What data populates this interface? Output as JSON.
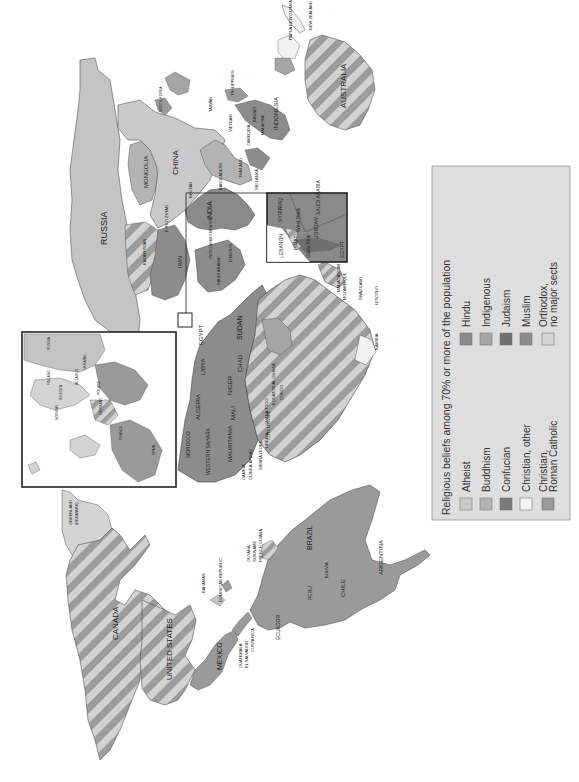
{
  "map": {
    "title": "Religious beliefs among 70% or more of the population",
    "orientation": "rotated-90-counterclockwise",
    "fill_colors": {
      "atheist": "#c9c9c9",
      "buddhism": "#b3b3b3",
      "confucian": "#7a7a7a",
      "christian_other": "#f2f2f2",
      "christian_roman_catholic": "#9a9a9a",
      "hindu": "#8a8a8a",
      "indigenous": "#a5a5a5",
      "judaism": "#6f6f6f",
      "muslim": "#8c8c8c",
      "orthodox": "#d4d4d4",
      "no_majority": "#c4c4c4",
      "stripe_dark": "#9c9c9c",
      "stripe_light": "#d2d2d2",
      "ocean": "#ffffff",
      "legend_bg": "#dedede",
      "border": "#333333"
    },
    "legend": {
      "title": "Religious beliefs among 70% or more of the population",
      "items": [
        {
          "key": "atheist",
          "label": "Atheist"
        },
        {
          "key": "buddhism",
          "label": "Buddhism"
        },
        {
          "key": "confucian",
          "label": "Confucian"
        },
        {
          "key": "christian_other",
          "label": "Christian, other"
        },
        {
          "key": "christian_roman_catholic",
          "label": "Christian,",
          "label2": "Roman Catholic"
        },
        {
          "key": "hindu",
          "label": "Hindu"
        },
        {
          "key": "indigenous",
          "label": "Indigenous"
        },
        {
          "key": "judaism",
          "label": "Judaism"
        },
        {
          "key": "muslim",
          "label": "Muslim"
        },
        {
          "key": "orthodox",
          "label": "Orthodox,",
          "label2": "no major sects"
        }
      ]
    },
    "countries": {
      "canada": "CANADA",
      "united_states": "UNITED STATES",
      "mexico": "MEXICO",
      "greenland": "GREENLAND",
      "greenland_sub": "(DENMARK)",
      "bahamas": "BAHAMAS",
      "cuba": "CUBA",
      "jamaica": "JAMAICA",
      "haiti": "HAITI",
      "dominican_republic": "DOMINICAN REPUBLIC",
      "belize": "BELIZE",
      "honduras": "HONDURAS",
      "guatemala": "GUATEMALA",
      "el_salvador": "EL SALVADOR",
      "nicaragua": "NICARAGUA",
      "costa_rica": "COSTA RICA",
      "panama": "PANAMA",
      "guyana": "GUYANA",
      "suriname": "SURINAME",
      "french_guiana": "FRENCH GUIANA",
      "venezuela": "VENEZUELA",
      "colombia": "COLOMBIA",
      "ecuador": "ECUADOR",
      "peru": "PERU",
      "brazil": "BRAZIL",
      "bolivia": "BOLIVIA",
      "paraguay": "PARAGUAY",
      "uruguay": "URUGUAY",
      "chile": "CHILE",
      "argentina": "ARGENTINA",
      "iceland": "ICELAND",
      "russia": "RUSSIA",
      "mongolia": "MONGOLIA",
      "china": "CHINA",
      "kazakhstan": "KAZAKHSTAN",
      "kyrgyzstan": "KYRGYZSTAN",
      "india": "INDIA",
      "bhutan": "BHUTAN",
      "bangladesh": "BANGLADESH",
      "sri_lanka": "SRI LANKA",
      "thailand": "THAILAND",
      "cambodia": "CAMBODIA",
      "vietnam": "VIETNAM",
      "malaysia": "MALAYSIA",
      "brunei": "BRUNEI",
      "philippines": "PHILIPPINES",
      "taiwan": "TAIWAN",
      "north_korea": "NORTH KOREA",
      "south_korea": "SOUTH KOREA",
      "japan": "JAPAN",
      "indonesia": "INDONESIA",
      "papua_new_guinea": "PAPUA NEW GUINEA",
      "australia": "AUSTRALIA",
      "new_zealand": "NEW ZEALAND",
      "iran": "IRAN",
      "saudi_arabia": "SAUDI ARABIA",
      "uae": "UNITED ARAB EMIRATES",
      "yemen": "YEMEN",
      "djibouti": "DJIBOUTI",
      "morocco": "MOROCCO",
      "western_sahara": "WESTERN SAHARA",
      "algeria": "ALGERIA",
      "libya": "LIBYA",
      "egypt": "EGYPT",
      "mauritania": "MAURITANIA",
      "mali": "MALI",
      "niger": "NIGER",
      "chad": "CHAD",
      "sudan": "SUDAN",
      "senegal": "SENEGAL",
      "gambia": "GAMBIA",
      "guinea_bissau": "GUINEA-BISSAU",
      "sierra_leone": "SIERRA LEONE",
      "liberia": "LIBERIA",
      "cote_divoire": "COTE D'IVOIRE",
      "ghana": "GHANA",
      "togo": "TOGO",
      "benin": "BENIN",
      "equatorial_guinea": "EQUATORIAL GUINEA",
      "congo": "CONGO",
      "madagascar": "MADAGASCAR",
      "mozambique": "MOZAMBIQUE",
      "swaziland": "SWAZILAND",
      "lesotho": "LESOTHO",
      "namibia": "NAMIBIA"
    },
    "europe_inset": {
      "labels": [
        "RUSSIA",
        "FINLAND",
        "SWEDEN",
        "NORWAY",
        "UKRAINE",
        "BELARUS",
        "POLAND",
        "GERMANY",
        "FRANCE",
        "SPAIN",
        "PORTUGAL",
        "UNITED KINGDOM",
        "IRELAND",
        "ICELAND",
        "ITALY",
        "MOLDOVA",
        "ROMANIA",
        "LITHUANIA",
        "LATVIA"
      ]
    },
    "middle_east_inset": {
      "labels": [
        "SYRIA",
        "IRAQ",
        "LEBANON",
        "ISRAEL",
        "Gaza Strip",
        "West Bank",
        "JORDAN",
        "SAUDI ARABIA",
        "EGYPT"
      ]
    }
  }
}
